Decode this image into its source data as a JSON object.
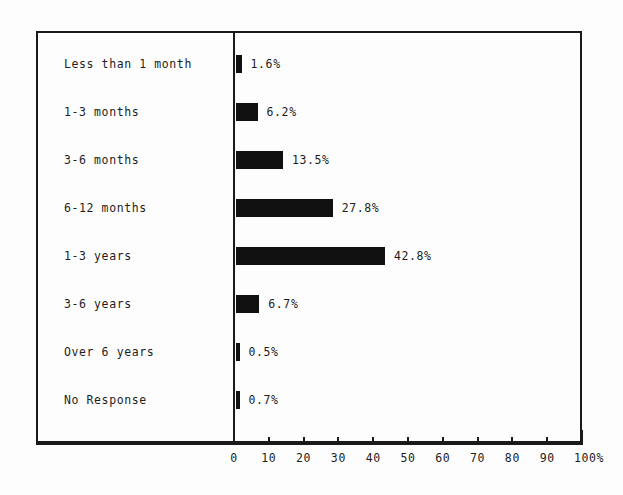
{
  "chart_data": {
    "type": "bar",
    "orientation": "horizontal",
    "title": "",
    "xlabel": "",
    "ylabel": "",
    "xlim": [
      0,
      100
    ],
    "grid": false,
    "legend": false,
    "categories": [
      "Less than 1 month",
      "1-3 months",
      "3-6 months",
      "6-12 months",
      "1-3 years",
      "3-6 years",
      "Over 6 years",
      "No Response"
    ],
    "values": [
      1.6,
      6.2,
      13.5,
      27.8,
      42.8,
      6.7,
      0.5,
      0.7
    ],
    "value_labels": [
      "1.6%",
      "6.2%",
      "13.5%",
      "27.8%",
      "42.8%",
      "6.7%",
      "0.5%",
      "0.7%"
    ],
    "x_ticks": [
      0,
      10,
      20,
      30,
      40,
      50,
      60,
      70,
      80,
      90,
      100
    ],
    "x_tick_labels": [
      "0",
      "10",
      "20",
      "30",
      "40",
      "50",
      "60",
      "70",
      "80",
      "90",
      "100%"
    ],
    "bar_color": "#111111",
    "axis_color": "#1a1a1a",
    "background_color": "#fdfdfd"
  }
}
